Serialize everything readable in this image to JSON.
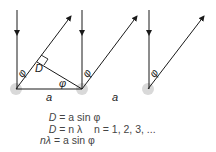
{
  "diagram": {
    "labels": {
      "angle": "φ",
      "path_difference": "D",
      "spacing_1": "a",
      "spacing_2": "a"
    },
    "colors": {
      "line": "#1a1a1a",
      "source_dot": "#d4d4d4"
    }
  },
  "equations": [
    {
      "lhs": "D",
      "rhs": "= a sin φ",
      "note": ""
    },
    {
      "lhs": "D",
      "rhs": "= n λ",
      "note": "n = 1, 2, 3, ..."
    },
    {
      "lhs": "nλ",
      "rhs": "= a sin φ",
      "note": ""
    }
  ]
}
